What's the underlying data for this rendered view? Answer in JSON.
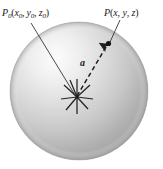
{
  "figure": {
    "background_color": "#ffffff",
    "labels": {
      "source_point": {
        "base": "P",
        "subscript": "0",
        "coords_open": "(",
        "x": "x",
        "x_sub": "0",
        "comma1": ", ",
        "y": "y",
        "y_sub": "0",
        "comma2": ", ",
        "z": "z",
        "z_sub": "0",
        "coords_close": ")",
        "full_text": "P0(x0, y0, z0)"
      },
      "field_point": {
        "base": "P",
        "coords_open": "(",
        "x": "x",
        "comma1": ", ",
        "y": "y",
        "comma2": ", ",
        "z": "z",
        "coords_close": ")",
        "full_text": "P(x, y, z)"
      },
      "vector": {
        "text": "a",
        "full_text": "a"
      }
    },
    "colors": {
      "sphere_highlight": "#fbfbfb",
      "sphere_mid": "#d8d8d8",
      "sphere_shadow": "#a6a6a6",
      "sphere_edge": "#9a9a9a",
      "line": "#2a2a2a",
      "text": "#1a1a1a",
      "dot": "#111111"
    },
    "geometry": {
      "sphere_center_x": 79,
      "sphere_center_y": 91,
      "sphere_radius_x": 69,
      "sphere_radius_y": 69,
      "source_point_x": 77,
      "source_point_y": 97,
      "field_point_x": 108,
      "field_point_y": 45,
      "starburst_rays": 9
    },
    "elements": {
      "sphere": "sphere-shape",
      "starburst": "point-source-starburst",
      "vector_arrow": "dashed-vector-arrow",
      "field_dot": "field-point-dot",
      "leader_p0": "leader-line-p0",
      "leader_p": "leader-line-p"
    }
  }
}
